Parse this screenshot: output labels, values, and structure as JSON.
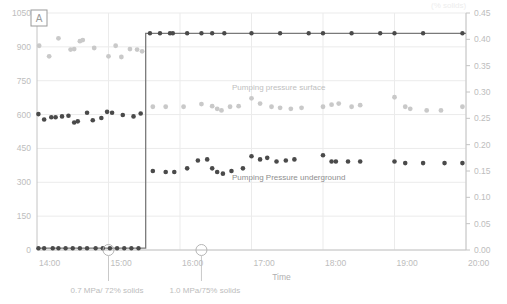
{
  "panel": {
    "letter": "A"
  },
  "corner_note": "(% solids)",
  "axes": {
    "x": {
      "title": "Time",
      "ticks": [
        "14:00",
        "15:00",
        "16:00",
        "17:00",
        "18:00",
        "19:00",
        "20:00"
      ],
      "min": 14.0,
      "max": 20.0
    },
    "y_left": {
      "ticks": [
        "0",
        "150",
        "300",
        "450",
        "600",
        "750",
        "900",
        "1050"
      ],
      "min": 0,
      "max": 1050
    },
    "y_right": {
      "ticks": [
        "0.00",
        "0.05",
        "0.10",
        "0.15",
        "0.20",
        "0.25",
        "0.30",
        "0.35",
        "0.40",
        "0.45"
      ],
      "min": 0.0,
      "max": 0.45
    }
  },
  "series_labels": {
    "surface": "Pumping pressure surface",
    "underground": "Pumping Pressure underground"
  },
  "annotations": [
    {
      "text": "0.7 MPa/ 72% solids",
      "x": 15.0
    },
    {
      "text": "1.0 MPa/75% solids",
      "x": 16.3
    }
  ],
  "colors": {
    "light_series": "#c9c9c9",
    "dark_series": "#4a4a4a",
    "step_line": "#7a7a7a",
    "grid": "#ebebeb",
    "axis": "#c4c4c4",
    "text": "#bdbdbd"
  },
  "chart_data": {
    "type": "scatter",
    "title": "",
    "xlabel": "Time",
    "ylabel": "",
    "xlim": [
      14.0,
      20.0
    ],
    "ylim": [
      0,
      1050
    ],
    "y2lim": [
      0.0,
      0.45
    ],
    "grid": true,
    "legend_position": "inline-annotation",
    "series": [
      {
        "name": "Pumping pressure surface",
        "axis": "left",
        "color": "#c9c9c9",
        "marker": "circle",
        "points": [
          [
            14.03,
            905
          ],
          [
            14.17,
            858
          ],
          [
            14.3,
            938
          ],
          [
            14.47,
            888
          ],
          [
            14.52,
            890
          ],
          [
            14.6,
            925
          ],
          [
            14.64,
            930
          ],
          [
            14.8,
            895
          ],
          [
            15.0,
            858
          ],
          [
            15.1,
            905
          ],
          [
            15.18,
            855
          ],
          [
            15.3,
            890
          ],
          [
            15.4,
            888
          ],
          [
            15.47,
            880
          ]
        ]
      },
      {
        "name": "Pumping pressure surface (post-step, right axis)",
        "axis": "right",
        "color": "#c9c9c9",
        "marker": "circle",
        "points": [
          [
            15.62,
            0.272
          ],
          [
            15.8,
            0.272
          ],
          [
            16.05,
            0.272
          ],
          [
            16.3,
            0.277
          ],
          [
            16.45,
            0.273
          ],
          [
            16.52,
            0.268
          ],
          [
            16.58,
            0.265
          ],
          [
            16.7,
            0.272
          ],
          [
            16.82,
            0.273
          ],
          [
            17.0,
            0.288
          ],
          [
            17.12,
            0.278
          ],
          [
            17.28,
            0.272
          ],
          [
            17.4,
            0.27
          ],
          [
            17.55,
            0.268
          ],
          [
            17.7,
            0.27
          ],
          [
            18.0,
            0.272
          ],
          [
            18.12,
            0.276
          ],
          [
            18.22,
            0.278
          ],
          [
            18.4,
            0.272
          ],
          [
            18.52,
            0.275
          ],
          [
            19.0,
            0.29
          ],
          [
            19.15,
            0.272
          ],
          [
            19.22,
            0.268
          ],
          [
            19.45,
            0.265
          ],
          [
            19.65,
            0.265
          ],
          [
            19.95,
            0.272
          ]
        ]
      },
      {
        "name": "Pumping Pressure underground",
        "axis": "left",
        "color": "#4a4a4a",
        "marker": "circle",
        "points": [
          [
            14.02,
            602
          ],
          [
            14.1,
            578
          ],
          [
            14.2,
            588
          ],
          [
            14.26,
            588
          ],
          [
            14.35,
            592
          ],
          [
            14.44,
            595
          ],
          [
            14.52,
            565
          ],
          [
            14.57,
            570
          ],
          [
            14.7,
            608
          ],
          [
            14.78,
            575
          ],
          [
            14.9,
            585
          ],
          [
            14.98,
            612
          ],
          [
            15.05,
            608
          ],
          [
            15.2,
            598
          ],
          [
            15.35,
            592
          ],
          [
            15.45,
            605
          ]
        ]
      },
      {
        "name": "Pumping Pressure underground (post-step, right axis)",
        "axis": "right",
        "color": "#4a4a4a",
        "marker": "circle",
        "points": [
          [
            15.62,
            0.15
          ],
          [
            15.8,
            0.148
          ],
          [
            15.92,
            0.148
          ],
          [
            16.1,
            0.155
          ],
          [
            16.25,
            0.17
          ],
          [
            16.38,
            0.172
          ],
          [
            16.45,
            0.155
          ],
          [
            16.52,
            0.148
          ],
          [
            16.6,
            0.145
          ],
          [
            16.72,
            0.15
          ],
          [
            16.88,
            0.155
          ],
          [
            17.0,
            0.178
          ],
          [
            17.12,
            0.172
          ],
          [
            17.22,
            0.175
          ],
          [
            17.35,
            0.168
          ],
          [
            17.48,
            0.17
          ],
          [
            17.6,
            0.172
          ],
          [
            18.0,
            0.18
          ],
          [
            18.12,
            0.168
          ],
          [
            18.18,
            0.168
          ],
          [
            18.35,
            0.168
          ],
          [
            18.52,
            0.168
          ],
          [
            19.0,
            0.168
          ],
          [
            19.15,
            0.165
          ],
          [
            19.4,
            0.165
          ],
          [
            19.7,
            0.165
          ],
          [
            19.95,
            0.165
          ]
        ]
      },
      {
        "name": "Step (flow rate / setpoint)",
        "axis": "left",
        "color": "#4a4a4a",
        "marker": "circle-line",
        "step_at": 15.52,
        "low_value": 8,
        "high_value": 960,
        "points_low": [
          [
            14.02,
            8
          ],
          [
            14.1,
            8
          ],
          [
            14.22,
            8
          ],
          [
            14.3,
            8
          ],
          [
            14.4,
            8
          ],
          [
            14.5,
            8
          ],
          [
            14.6,
            8
          ],
          [
            14.7,
            8
          ],
          [
            14.82,
            8
          ],
          [
            14.92,
            8
          ],
          [
            15.02,
            8
          ],
          [
            15.12,
            8
          ],
          [
            15.22,
            8
          ],
          [
            15.32,
            8
          ],
          [
            15.42,
            8
          ]
        ],
        "points_high": [
          [
            15.58,
            960
          ],
          [
            15.72,
            960
          ],
          [
            15.86,
            960
          ],
          [
            15.9,
            960
          ],
          [
            16.1,
            960
          ],
          [
            16.3,
            960
          ],
          [
            16.45,
            960
          ],
          [
            16.62,
            960
          ],
          [
            17.0,
            960
          ],
          [
            17.4,
            960
          ],
          [
            17.8,
            960
          ],
          [
            18.0,
            960
          ],
          [
            18.4,
            960
          ],
          [
            18.8,
            960
          ],
          [
            19.0,
            960
          ],
          [
            19.4,
            960
          ],
          [
            19.95,
            960
          ]
        ]
      }
    ],
    "callout_markers": [
      {
        "x": 15.0,
        "label": "0.7 MPa/ 72% solids"
      },
      {
        "x": 16.3,
        "label": "1.0 MPa/75% solids"
      }
    ]
  }
}
